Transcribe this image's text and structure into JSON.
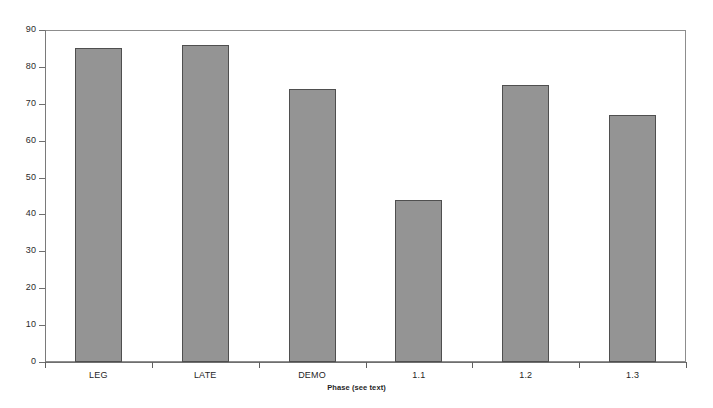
{
  "chart_data": {
    "type": "bar",
    "title": "",
    "subtitle": "",
    "xlabel": "Phase (see text)",
    "ylabel": "",
    "categories": [
      "LEG",
      "LATE",
      "DEMO",
      "1.1",
      "1.2",
      "1.3"
    ],
    "values": [
      85,
      86,
      74,
      44,
      75,
      67
    ],
    "series": [
      {
        "name": "",
        "values": [
          85,
          86,
          74,
          44,
          75,
          67
        ]
      }
    ],
    "ylim": [
      0,
      90
    ],
    "y_ticks": [
      0,
      10,
      20,
      30,
      40,
      50,
      60,
      70,
      80,
      90
    ],
    "y_tick_labels": [
      "0",
      "10",
      "20",
      "30",
      "40",
      "50",
      "60",
      "70",
      "80",
      "90"
    ],
    "grid": false,
    "legend": null,
    "legend_position": "none",
    "bar_color": "#949494",
    "bar_edge_color": "#4f4f4f",
    "frame_color": "#8d8d8d",
    "background": "#ffffff",
    "annotations": []
  }
}
